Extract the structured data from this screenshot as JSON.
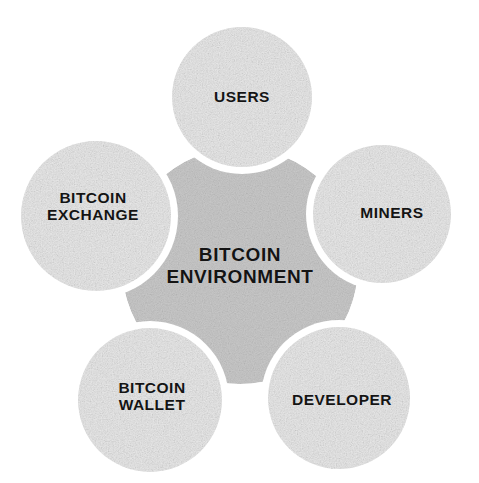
{
  "diagram": {
    "type": "hub-and-spoke-venn",
    "title_text": "BITCOIN\nENVIRONMENT",
    "background_color": "#ffffff",
    "hub": {
      "name": "bitcoin-environment",
      "label": "BITCOIN\nENVIRONMENT",
      "fill_color": "#c9c9c9",
      "text_color": "#141414",
      "cx": 240,
      "cy": 266,
      "r": 118
    },
    "gap_color": "#ffffff",
    "gap_width": 7,
    "satellites": [
      {
        "name": "users",
        "label": "USERS",
        "fill_color": "#e9e9e9",
        "text_color": "#141414",
        "cx": 242,
        "cy": 97,
        "r": 70,
        "label_offset_x": 0,
        "label_offset_y": 0,
        "position": "top"
      },
      {
        "name": "miners",
        "label": "MINERS",
        "fill_color": "#e9e9e9",
        "text_color": "#141414",
        "cx": 382,
        "cy": 214,
        "r": 69,
        "label_offset_x": 10,
        "label_offset_y": -1,
        "position": "right"
      },
      {
        "name": "bitcoin-exchange",
        "label": "BITCOIN\nEXCHANGE",
        "fill_color": "#e9e9e9",
        "text_color": "#141414",
        "cx": 96,
        "cy": 216,
        "r": 75,
        "label_offset_x": -3,
        "label_offset_y": -10,
        "position": "left"
      },
      {
        "name": "bitcoin-wallet",
        "label": "BITCOIN\nWALLET",
        "fill_color": "#e9e9e9",
        "text_color": "#141414",
        "cx": 150,
        "cy": 400,
        "r": 72,
        "label_offset_x": 2,
        "label_offset_y": -4,
        "position": "bottom-left"
      },
      {
        "name": "developer",
        "label": "DEVELOPER",
        "fill_color": "#e9e9e9",
        "text_color": "#141414",
        "cx": 339,
        "cy": 398,
        "r": 71,
        "label_offset_x": 3,
        "label_offset_y": 2,
        "position": "bottom-right"
      }
    ]
  }
}
